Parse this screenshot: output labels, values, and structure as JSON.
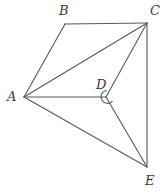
{
  "figure": {
    "type": "geometry-diagram",
    "background_color": "#ffffff",
    "stroke_color": "#5a5a5a",
    "label_color": "#3a3a3a",
    "stroke_width": 1.1,
    "points": {
      "A": {
        "x": 24,
        "y": 97
      },
      "B": {
        "x": 65,
        "y": 24
      },
      "C": {
        "x": 147,
        "y": 23
      },
      "D": {
        "x": 106,
        "y": 97
      },
      "E": {
        "x": 147,
        "y": 167
      }
    },
    "segments": [
      {
        "name": "A-B",
        "from": "A",
        "to": "B"
      },
      {
        "name": "B-C",
        "from": "B",
        "to": "C"
      },
      {
        "name": "A-C",
        "from": "A",
        "to": "C"
      },
      {
        "name": "C-E",
        "from": "C",
        "to": "E"
      },
      {
        "name": "A-D",
        "from": "A",
        "to": "D"
      },
      {
        "name": "C-D",
        "from": "C",
        "to": "D"
      },
      {
        "name": "D-E",
        "from": "D",
        "to": "E"
      },
      {
        "name": "A-E",
        "from": "A",
        "to": "E"
      }
    ],
    "angle_marker": {
      "at": "D",
      "radius": 6.5,
      "shape": "arc"
    },
    "labels": [
      {
        "key": "A",
        "text": "A",
        "x": 7,
        "y": 90
      },
      {
        "key": "B",
        "text": "B",
        "x": 59,
        "y": 4
      },
      {
        "key": "C",
        "text": "C",
        "x": 150,
        "y": 4
      },
      {
        "key": "D",
        "text": "D",
        "x": 96,
        "y": 78
      },
      {
        "key": "E",
        "text": "E",
        "x": 145,
        "y": 174
      }
    ]
  }
}
